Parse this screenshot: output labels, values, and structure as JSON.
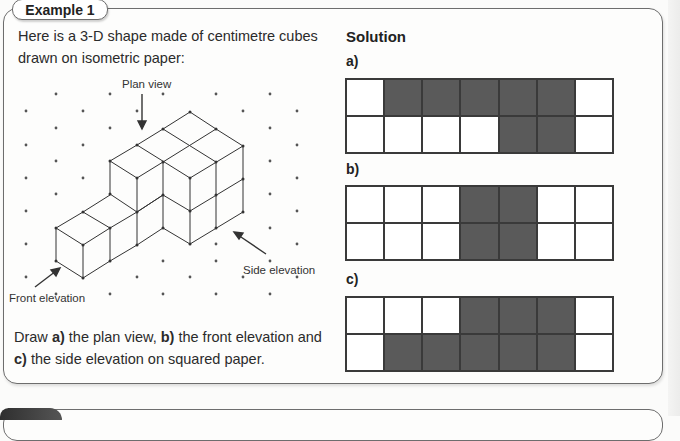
{
  "example": {
    "tab_label": "Example 1",
    "intro_text": "Here is a 3-D shape made of centimetre cubes drawn on isometric paper:",
    "figure_labels": {
      "plan_view": "Plan view",
      "front_elevation": "Front elevation",
      "side_elevation": "Side elevation"
    },
    "instructions": {
      "a_label": "a)",
      "a_text": " the plan view, ",
      "b_label": "b)",
      "b_text": " the front elevation and",
      "c_label": "c)",
      "c_text": " the side elevation on squared paper.",
      "prefix": "Draw "
    }
  },
  "solution": {
    "title": "Solution",
    "parts": [
      {
        "label": "a)",
        "rows": [
          [
            0,
            1,
            1,
            1,
            1,
            1,
            0
          ],
          [
            0,
            0,
            0,
            0,
            1,
            1,
            0
          ]
        ]
      },
      {
        "label": "b)",
        "rows": [
          [
            0,
            0,
            0,
            1,
            1,
            0,
            0
          ],
          [
            0,
            0,
            0,
            1,
            1,
            0,
            0
          ]
        ]
      },
      {
        "label": "c)",
        "rows": [
          [
            0,
            0,
            0,
            1,
            1,
            1,
            0
          ],
          [
            0,
            1,
            1,
            1,
            1,
            1,
            0
          ]
        ]
      }
    ]
  },
  "colors": {
    "filled_cell": "#5a5a5a",
    "border": "#6d6d6d"
  }
}
